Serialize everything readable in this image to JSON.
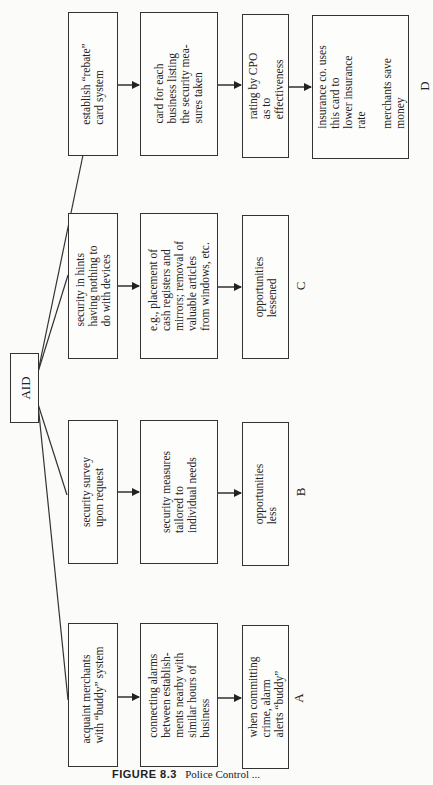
{
  "diagram": {
    "orientation": "rotated 90deg counter-clockwise",
    "root": {
      "label": "AID"
    },
    "branches": [
      {
        "id": "D",
        "label": "D",
        "steps": [
          "establish “rebate”\ncard system",
          "card for each\nbusiness listing\nthe security mea-\nsures taken",
          "rating by CPO\nas to\neffectiveness",
          "insurance co. uses\nthis card to\nlower insurance\nrate\n\nmerchants save\nmoney"
        ]
      },
      {
        "id": "C",
        "label": "C",
        "steps": [
          "security in hints\nhaving nothing to\ndo with devices",
          "e.g., placement of\ncash registers and\nmirrors; removal of\nvaluable articles\nfrom windows, etc.",
          "opportunities\nlessened"
        ]
      },
      {
        "id": "B",
        "label": "B",
        "steps": [
          "security survey\nupon request",
          "security measures\ntailored to\nindividual needs",
          "opportunities\nless"
        ]
      },
      {
        "id": "A",
        "label": "A",
        "steps": [
          "acquaint merchants\nwith “buddy” system",
          "connecting alarms\nbetween establish-\nments nearby with\nsimilar hours of\nbusiness",
          "when committing\ncrime, alarm\nalerts “buddy”"
        ]
      }
    ]
  },
  "caption": {
    "figure_number": "FIGURE 8.3",
    "text": "Police Control ..."
  }
}
